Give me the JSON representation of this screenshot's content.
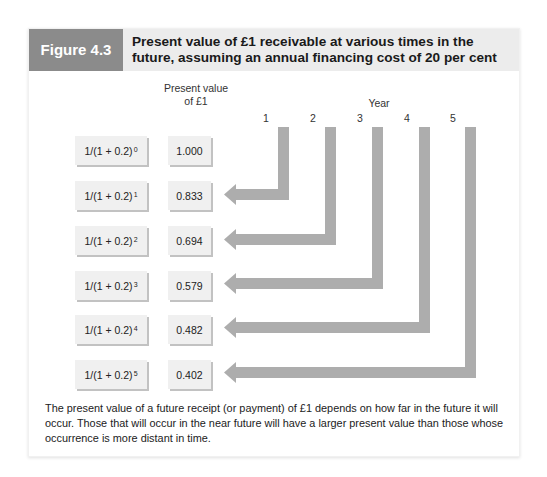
{
  "figure": {
    "label": "Figure 4.3",
    "title": "Present value of £1 receivable at various times in the future, assuming an annual financing cost of 20 per cent",
    "header_colors": {
      "label_bg": "#8b8b8b",
      "title_bg": "#ececec"
    }
  },
  "diagram": {
    "column_heading_line1": "Present value",
    "column_heading_line2": "of £1",
    "year_heading": "Year",
    "years": [
      "1",
      "2",
      "3",
      "4",
      "5"
    ],
    "rows": [
      {
        "formula_base": "1/(1 + 0.2)",
        "exponent": "0",
        "value": "1.000"
      },
      {
        "formula_base": "1/(1 + 0.2)",
        "exponent": "1",
        "value": "0.833"
      },
      {
        "formula_base": "1/(1 + 0.2)",
        "exponent": "2",
        "value": "0.694"
      },
      {
        "formula_base": "1/(1 + 0.2)",
        "exponent": "3",
        "value": "0.579"
      },
      {
        "formula_base": "1/(1 + 0.2)",
        "exponent": "4",
        "value": "0.482"
      },
      {
        "formula_base": "1/(1 + 0.2)",
        "exponent": "5",
        "value": "0.402"
      }
    ],
    "arrow_color": "#adadad",
    "box_color": "#f0f0f0"
  },
  "caption": "The present value of a future receipt (or payment) of £1 depends on how far in the future it will occur. Those that will occur in the near future will have a larger present value than those whose occurrence is more distant in time."
}
